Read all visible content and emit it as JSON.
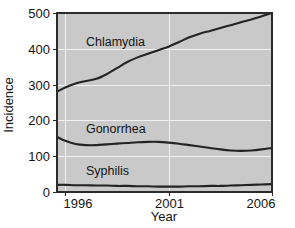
{
  "chart_data": {
    "type": "line",
    "title": "",
    "xlabel": "Year",
    "ylabel": "Incidence",
    "xlim": [
      1995.6,
      2006
    ],
    "ylim": [
      0,
      500
    ],
    "xticks": [
      "1996",
      "2001",
      "2006"
    ],
    "xtick_values": [
      1996,
      2001,
      2006
    ],
    "yticks": [
      "0",
      "100",
      "200",
      "300",
      "400",
      "500"
    ],
    "ytick_values": [
      0,
      100,
      200,
      300,
      400,
      500
    ],
    "grid": true,
    "grid_color": "#f2f2f2",
    "plot_background": "#c9c9c9",
    "line_color": "#232323",
    "legend": "inline-labels",
    "x": [
      1995.6,
      1996,
      1996.5,
      1997,
      1997.5,
      1998,
      1998.5,
      1999,
      1999.5,
      2000,
      2000.5,
      2001,
      2001.5,
      2002,
      2002.5,
      2003,
      2003.5,
      2004,
      2004.5,
      2005,
      2005.5,
      2006
    ],
    "series": [
      {
        "name": "Chlamydia",
        "label": "Chlamydia",
        "label_x": 1997.0,
        "label_y": 420,
        "values": [
          280,
          292,
          303,
          310,
          316,
          329,
          346,
          363,
          376,
          386,
          396,
          406,
          419,
          432,
          442,
          450,
          458,
          466,
          474,
          482,
          491,
          500
        ]
      },
      {
        "name": "Gonorrhea",
        "label": "Gonorrhea",
        "label_x": 1997.0,
        "label_y": 175,
        "values": [
          154,
          143,
          134,
          131,
          131,
          133,
          135,
          137,
          139,
          140,
          140,
          138,
          135,
          131,
          127,
          123,
          119,
          116,
          115,
          116,
          119,
          123
        ]
      },
      {
        "name": "Syphilis",
        "label": "Syphilis",
        "label_x": 1997.0,
        "label_y": 58,
        "values": [
          20,
          20,
          19,
          19,
          18,
          18,
          17,
          17,
          16,
          16,
          15,
          15,
          15,
          16,
          16,
          17,
          17,
          18,
          19,
          20,
          21,
          22
        ]
      }
    ]
  }
}
